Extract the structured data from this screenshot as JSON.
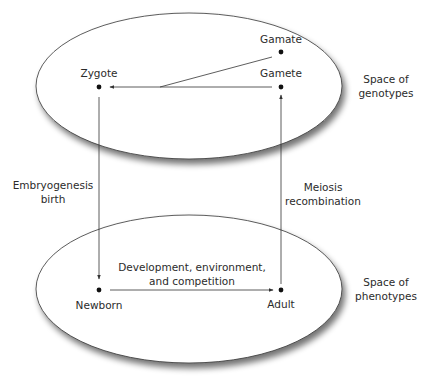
{
  "diagram": {
    "spaces": {
      "genotypes": {
        "line1": "Space of",
        "line2": "genotypes"
      },
      "phenotypes": {
        "line1": "Space of",
        "line2": "phenotypes"
      }
    },
    "nodes": {
      "zygote": "Zygote",
      "gamete": "Gamete",
      "gamate": "Gamate",
      "newborn": "Newborn",
      "adult": "Adult"
    },
    "edges": {
      "embryogenesis": {
        "line1": "Embryogenesis",
        "line2": "birth"
      },
      "meiosis": {
        "line1": "Meiosis",
        "line2": "recombination"
      },
      "development": {
        "line1": "Development, environment,",
        "line2": "and competition"
      }
    },
    "colors": {
      "stroke": "#333333",
      "text": "#2b2b2b",
      "shadow": "#7a7a7a"
    }
  }
}
